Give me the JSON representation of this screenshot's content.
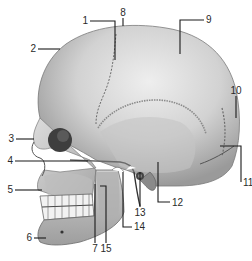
{
  "figure": {
    "background": "#ffffff",
    "bone_color_light": "#e2e2e2",
    "bone_color_mid": "#b8b8b8",
    "bone_color_dark": "#6e6e6e",
    "label_color": "#2a2a2a",
    "leader_color": "#1a1a1a"
  },
  "labels": [
    {
      "num": "1",
      "x": 88,
      "y": 24,
      "anchor": "end"
    },
    {
      "num": "2",
      "x": 36,
      "y": 52,
      "anchor": "end"
    },
    {
      "num": "3",
      "x": 14,
      "y": 142,
      "anchor": "end"
    },
    {
      "num": "4",
      "x": 13,
      "y": 164,
      "anchor": "end"
    },
    {
      "num": "5",
      "x": 13,
      "y": 193,
      "anchor": "end"
    },
    {
      "num": "6",
      "x": 32,
      "y": 241,
      "anchor": "end"
    },
    {
      "num": "7",
      "x": 95,
      "y": 252,
      "anchor": "middle"
    },
    {
      "num": "8",
      "x": 123,
      "y": 16,
      "anchor": "middle"
    },
    {
      "num": "9",
      "x": 206,
      "y": 23,
      "anchor": "start"
    },
    {
      "num": "10",
      "x": 236,
      "y": 94,
      "anchor": "middle"
    },
    {
      "num": "11",
      "x": 243,
      "y": 186,
      "anchor": "start"
    },
    {
      "num": "12",
      "x": 172,
      "y": 206,
      "anchor": "start"
    },
    {
      "num": "13",
      "x": 140,
      "y": 216,
      "anchor": "middle"
    },
    {
      "num": "14",
      "x": 134,
      "y": 230,
      "anchor": "start"
    },
    {
      "num": "15",
      "x": 106,
      "y": 252,
      "anchor": "middle"
    }
  ]
}
